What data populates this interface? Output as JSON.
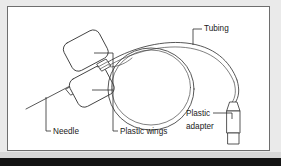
{
  "figure": {
    "type": "line-diagram",
    "background_color": "#ffffff",
    "line_color": "#3a3a3a",
    "frame_color": "#6e6e6e",
    "surface_color": "#eaeaea",
    "band_color": "#141414",
    "labels": [
      {
        "id": "tubing",
        "text": "Tubing",
        "x": 196,
        "y": 24,
        "anchor": "start",
        "lines": [
          "Tubing"
        ]
      },
      {
        "id": "needle",
        "text": "Needle",
        "x": 44,
        "y": 128,
        "anchor": "start",
        "lines": [
          "Needle"
        ]
      },
      {
        "id": "plastic-wings",
        "text": "Plastic wings",
        "x": 111,
        "y": 128,
        "anchor": "start",
        "lines": [
          "Plastic wings"
        ]
      },
      {
        "id": "plastic-adapter",
        "text": "Plastic adapter",
        "x": 178,
        "y": 112,
        "anchor": "start",
        "lines": [
          "Plastic",
          "adapter"
        ]
      }
    ],
    "parts": [
      {
        "id": "needle-shaft",
        "name": "Needle"
      },
      {
        "id": "wing-upper",
        "name": "Plastic wings"
      },
      {
        "id": "wing-lower",
        "name": "Plastic wings"
      },
      {
        "id": "tubing-coil",
        "name": "Tubing"
      },
      {
        "id": "adapter-body",
        "name": "Plastic adapter"
      }
    ]
  }
}
